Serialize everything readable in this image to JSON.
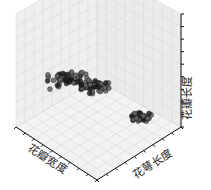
{
  "chart_data": {
    "type": "scatter",
    "projection": "3d",
    "title": "",
    "xlabel": "花瓣宽度",
    "ylabel": "花萼长度",
    "zlabel": "花瓣长度",
    "grid": true,
    "tick_labels_visible": false,
    "clusters": [
      {
        "name": "cluster-1",
        "approx_points": 50,
        "location": "upper-left, high 花瓣长度"
      },
      {
        "name": "cluster-2",
        "approx_points": 50,
        "location": "center, mid"
      },
      {
        "name": "cluster-3",
        "approx_points": 30,
        "location": "lower-right, low 花瓣长度"
      }
    ],
    "marker_color": "#222222"
  },
  "labels": {
    "x": "花瓣宽度",
    "y": "花萼长度",
    "z": "花瓣长度"
  }
}
